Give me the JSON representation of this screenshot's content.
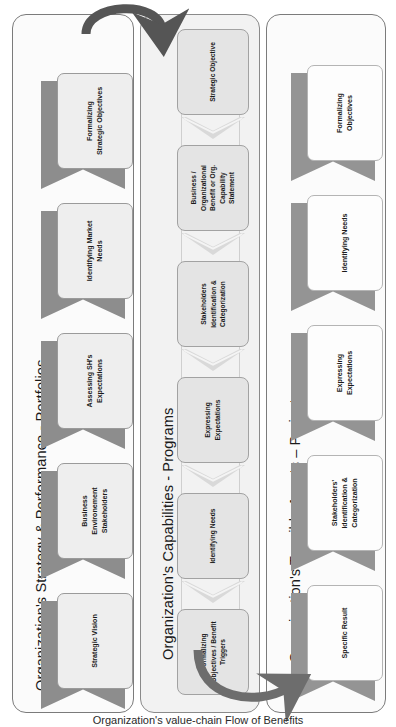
{
  "diagram": {
    "caption": "Organization's value-chain Flow of Benefits",
    "colors": {
      "panel_border": "#7b7b7b",
      "panel_fill_light": "#fbfbfb",
      "panel_fill_mid": "#f2f2f2",
      "ribbon_tail": "#8d8d8d",
      "card_fill": "#eeeeee",
      "arrow_dark": "#585858",
      "arrow_mid": "#7a7a7a",
      "text": "#1b1b1b"
    }
  },
  "panels": [
    {
      "id": "portfolios",
      "title": "Organization's Strategy & Performance - Portfolios",
      "steps": [
        {
          "label": "Strategic Vision"
        },
        {
          "label": "Business\nEnvironement\nStakeholders"
        },
        {
          "label": "Assessing SH's\nExpectations"
        },
        {
          "label": "Identifying Market\nNeeds"
        },
        {
          "label": "Formalizing\nStrategic Objectives"
        }
      ]
    },
    {
      "id": "programs",
      "title": "Organization's Capabilities - Programs",
      "steps": [
        {
          "label": "Formalizing\nObjectives / Benefit\nTriggers"
        },
        {
          "label": "Identifying Needs"
        },
        {
          "label": "Expressing\nExpectations"
        },
        {
          "label": "Stakeholders\nIdentification &\nCategorization"
        },
        {
          "label": "Business /\nOrganizational\nBenefit or Org.\nCapability\nStatement"
        },
        {
          "label": "Strategic Objective"
        }
      ]
    },
    {
      "id": "projects",
      "title": "Organization's Tangible Assets – Projects",
      "steps": [
        {
          "label": "Specific Result"
        },
        {
          "label": "Stakeholders'\nIdentification &\nCategorization"
        },
        {
          "label": "Expressing\nExpectations"
        },
        {
          "label": "Identifying Needs"
        },
        {
          "label": "Formalizing\nObjectives"
        }
      ]
    }
  ],
  "connectors": [
    {
      "id": "top-arrow",
      "from": "portfolios",
      "to": "programs",
      "direction": "left-to-right",
      "style": "curved-arc-dark"
    },
    {
      "id": "bottom-arrow",
      "from": "programs",
      "to": "projects",
      "direction": "left-to-right",
      "style": "curved-arc-dark"
    }
  ]
}
